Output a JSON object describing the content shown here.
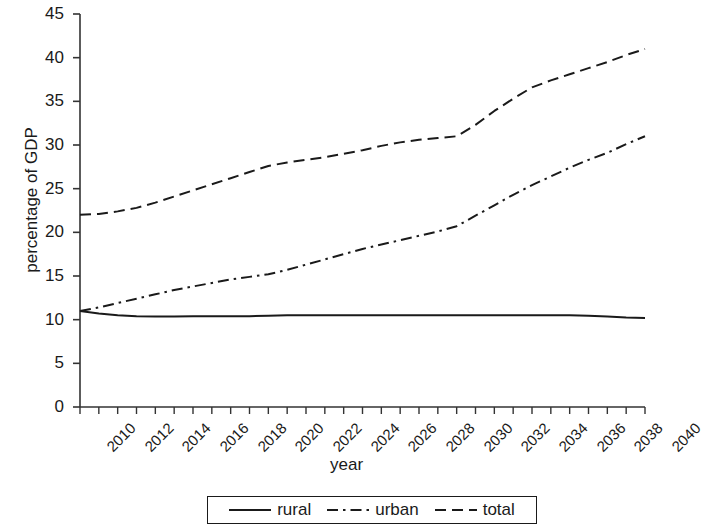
{
  "chart_data": {
    "type": "line",
    "title": "",
    "xlabel": "year",
    "ylabel": "percentage of GDP",
    "xlim": [
      2010,
      2040
    ],
    "ylim": [
      0,
      45
    ],
    "grid": false,
    "legend_position": "bottom",
    "x": [
      2010,
      2011,
      2012,
      2013,
      2014,
      2015,
      2016,
      2017,
      2018,
      2019,
      2020,
      2021,
      2022,
      2023,
      2024,
      2025,
      2026,
      2027,
      2028,
      2029,
      2030,
      2031,
      2032,
      2033,
      2034,
      2035,
      2036,
      2037,
      2038,
      2039,
      2040
    ],
    "xticks": [
      "2010",
      "2012",
      "2014",
      "2016",
      "2018",
      "2020",
      "2022",
      "2024",
      "2026",
      "2028",
      "2030",
      "2032",
      "2034",
      "2036",
      "2038",
      "2040"
    ],
    "yticks": [
      "0",
      "5",
      "10",
      "15",
      "20",
      "25",
      "30",
      "35",
      "40",
      "45"
    ],
    "series": [
      {
        "name": "rural",
        "style": "solid",
        "color": "#1a1a1a",
        "values": [
          11.0,
          10.7,
          10.5,
          10.4,
          10.35,
          10.35,
          10.4,
          10.4,
          10.4,
          10.4,
          10.45,
          10.5,
          10.5,
          10.5,
          10.5,
          10.5,
          10.5,
          10.5,
          10.5,
          10.5,
          10.5,
          10.5,
          10.5,
          10.5,
          10.5,
          10.5,
          10.5,
          10.45,
          10.35,
          10.25,
          10.2
        ]
      },
      {
        "name": "urban",
        "style": "dashdot",
        "color": "#1a1a1a",
        "values": [
          11.0,
          11.4,
          11.9,
          12.4,
          12.9,
          13.4,
          13.8,
          14.2,
          14.6,
          14.9,
          15.2,
          15.7,
          16.3,
          16.9,
          17.5,
          18.1,
          18.6,
          19.1,
          19.6,
          20.1,
          20.7,
          21.9,
          23.1,
          24.3,
          25.4,
          26.4,
          27.4,
          28.3,
          29.1,
          30.1,
          31.0
        ]
      },
      {
        "name": "total",
        "style": "dashed",
        "color": "#1a1a1a",
        "values": [
          22.0,
          22.1,
          22.4,
          22.8,
          23.4,
          24.1,
          24.8,
          25.5,
          26.2,
          26.9,
          27.6,
          28.0,
          28.3,
          28.6,
          29.0,
          29.4,
          29.9,
          30.3,
          30.6,
          30.8,
          31.0,
          32.3,
          33.9,
          35.3,
          36.6,
          37.4,
          38.1,
          38.8,
          39.5,
          40.3,
          41.0
        ]
      }
    ]
  },
  "legend": {
    "items": [
      {
        "label": "rural",
        "style": "solid"
      },
      {
        "label": "urban",
        "style": "dashdot"
      },
      {
        "label": "total",
        "style": "dashed"
      }
    ]
  }
}
